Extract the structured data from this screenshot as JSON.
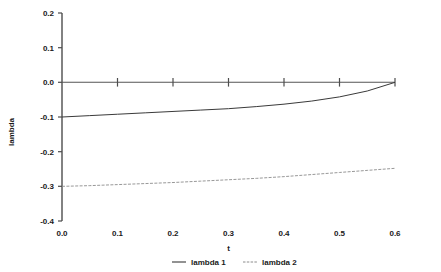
{
  "chart_data": {
    "type": "line",
    "title": "",
    "xlabel": "t",
    "ylabel": "lambda",
    "xlim": [
      0.0,
      0.6
    ],
    "ylim": [
      -0.4,
      0.2
    ],
    "grid": false,
    "legend_position": "bottom",
    "x_ticks": [
      0.0,
      0.1,
      0.2,
      0.3,
      0.4,
      0.5,
      0.6
    ],
    "x_tick_labels": [
      "0.0",
      "0.1",
      "0.2",
      "0.3",
      "0.4",
      "0.5",
      "0.6"
    ],
    "y_ticks": [
      0.2,
      0.1,
      0.0,
      -0.1,
      -0.2,
      -0.3,
      -0.4
    ],
    "y_tick_labels": [
      "0.2",
      "0.1",
      "0.0",
      "-0.1",
      "-0.2",
      "-0.3",
      "-0.4"
    ],
    "x": [
      0.0,
      0.05,
      0.1,
      0.15,
      0.2,
      0.25,
      0.3,
      0.35,
      0.4,
      0.45,
      0.5,
      0.55,
      0.6
    ],
    "series": [
      {
        "name": "lambda 1",
        "style": "solid",
        "color": "#3a3a3a",
        "values": [
          -0.1,
          -0.096,
          -0.092,
          -0.088,
          -0.084,
          -0.08,
          -0.076,
          -0.07,
          -0.063,
          -0.054,
          -0.042,
          -0.025,
          0.0
        ]
      },
      {
        "name": "lambda 2",
        "style": "dashed",
        "color": "#8c8c8c",
        "values": [
          -0.3,
          -0.298,
          -0.295,
          -0.292,
          -0.289,
          -0.285,
          -0.281,
          -0.277,
          -0.272,
          -0.266,
          -0.26,
          -0.254,
          -0.248
        ]
      },
      {
        "name": "zero-reference",
        "style": "solid",
        "color": "#555555",
        "values": [
          0.0,
          0.0,
          0.0,
          0.0,
          0.0,
          0.0,
          0.0,
          0.0,
          0.0,
          0.0,
          0.0,
          0.0,
          0.0
        ]
      }
    ]
  },
  "axes": {
    "x_label": "t",
    "y_label": "lambda"
  },
  "legend": {
    "items": [
      {
        "label": "lambda 1"
      },
      {
        "label": "lambda 2"
      }
    ]
  }
}
